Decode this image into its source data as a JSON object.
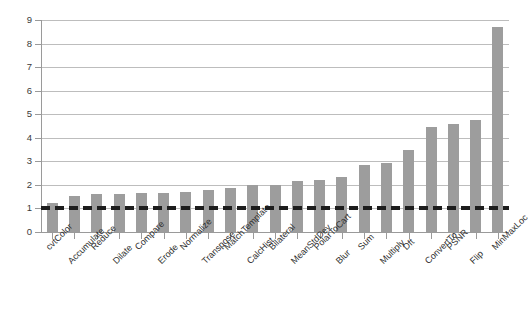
{
  "chart_data": {
    "type": "bar",
    "title": "",
    "subtitle": "",
    "xlabel": "",
    "ylabel": "",
    "ylim": [
      0,
      9
    ],
    "ytick_step": 1,
    "grid": true,
    "legend": null,
    "bar_color": "#9d9d9d",
    "gridline_color": "#bdbdbd",
    "axis_color": "#9a9a9a",
    "threshold": {
      "value": 1,
      "style": "dashed",
      "color": "#1d1d1d",
      "label": ""
    },
    "ticks": [
      "0",
      "1",
      "2",
      "3",
      "4",
      "5",
      "6",
      "7",
      "8",
      "9"
    ],
    "categories": [
      "cvtColor",
      "Accumulate",
      "Reduce",
      "Dilate",
      "Compare",
      "Erode",
      "Normalize",
      "Transpose",
      "MatchTemplate",
      "CalcHist",
      "Bilateral",
      "MeanStdDev",
      "PolarToCart",
      "Blur",
      "Sum",
      "Multiply",
      "Dft",
      "ConvertTo",
      "PSNR",
      "Flip",
      "MinMaxLoc"
    ],
    "values": [
      1.25,
      1.55,
      1.6,
      1.6,
      1.67,
      1.67,
      1.72,
      1.8,
      1.88,
      2.0,
      2.0,
      2.15,
      2.2,
      2.35,
      2.85,
      2.95,
      3.5,
      4.45,
      4.6,
      4.75,
      8.7
    ]
  }
}
